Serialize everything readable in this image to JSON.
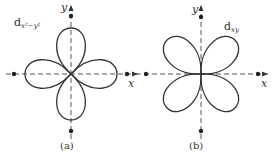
{
  "panels": [
    {
      "id": "a",
      "orbital_label": "d",
      "orbital_subscript": "x²−y²",
      "x_axis_label": "x",
      "y_axis_label": "y",
      "caption": "(a)",
      "lobe_orientation": "along axes"
    },
    {
      "id": "b",
      "orbital_label": "d",
      "orbital_subscript": "xy",
      "x_axis_label": "x",
      "y_axis_label": "y",
      "caption": "(b)",
      "lobe_orientation": "between axes (45°)"
    }
  ],
  "colors": {
    "line": "#333333",
    "axis": "#555555",
    "background": "#ffffff"
  }
}
